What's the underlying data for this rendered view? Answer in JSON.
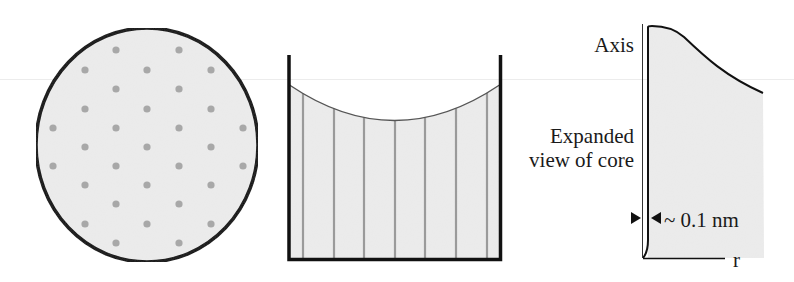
{
  "figure": {
    "panels": [
      {
        "id": "cross-section",
        "description": "Circular cross-section with hexagonal array of dots",
        "fill_color": "#ececec",
        "outline_color": "#111111",
        "dot_color": "#a8a8a8",
        "dots": [
          [
            116,
            50
          ],
          [
            179,
            50
          ],
          [
            85,
            70
          ],
          [
            147,
            70
          ],
          [
            211,
            70
          ],
          [
            116,
            89
          ],
          [
            179,
            89
          ],
          [
            85,
            109
          ],
          [
            147,
            109
          ],
          [
            211,
            109
          ],
          [
            53,
            128
          ],
          [
            116,
            128
          ],
          [
            179,
            128
          ],
          [
            243,
            128
          ],
          [
            85,
            147
          ],
          [
            147,
            147
          ],
          [
            211,
            147
          ],
          [
            53,
            166
          ],
          [
            116,
            166
          ],
          [
            179,
            166
          ],
          [
            243,
            166
          ],
          [
            85,
            185
          ],
          [
            147,
            185
          ],
          [
            211,
            185
          ],
          [
            116,
            204
          ],
          [
            179,
            204
          ],
          [
            85,
            224
          ],
          [
            147,
            224
          ],
          [
            211,
            224
          ],
          [
            116,
            243
          ],
          [
            179,
            243
          ]
        ]
      },
      {
        "id": "container",
        "description": "Container with curved meniscus and vertical lines",
        "fill_color": "#ececec",
        "line_color": "#9a9a9a",
        "vertical_lines_x": [
          303,
          334,
          364,
          395,
          425,
          456,
          487
        ]
      },
      {
        "id": "core-profile",
        "description": "Expanded view of core profile vs r",
        "labels": {
          "axis": "Axis",
          "expanded_line1": "Expanded",
          "expanded_line2": "view of core",
          "width_annotation": "~ 0.1 nm",
          "r_axis": "r"
        },
        "fill_color": "#ececec"
      }
    ]
  }
}
